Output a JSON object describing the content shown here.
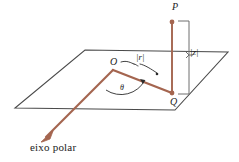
{
  "figure": {
    "colors": {
      "plane_outline": "#4a4a4a",
      "vector": "#a4654f",
      "bracket": "#6e6e6e",
      "text": "#1b1b1b",
      "background": "#ffffff"
    },
    "labels": {
      "point_p": "P",
      "point_q": "Q",
      "origin_o": "O",
      "magnitude_r": "|r|",
      "magnitude_z": "|z|",
      "angle_theta": "θ",
      "polar_axis": "eixo polar"
    },
    "icon_names": {
      "plane": "parallelogram-plane-icon",
      "vertical_segment": "vertical-segment-pq-icon",
      "radial_segment": "radial-segment-oq-icon",
      "polar_axis_arrow": "polar-axis-arrow-icon",
      "z_bracket": "z-height-bracket-icon",
      "r_brace": "r-length-brace-icon",
      "theta_arc": "theta-angle-arc-icon",
      "point_marker_p": "point-marker-p-icon",
      "point_marker_q": "point-marker-q-icon"
    }
  }
}
